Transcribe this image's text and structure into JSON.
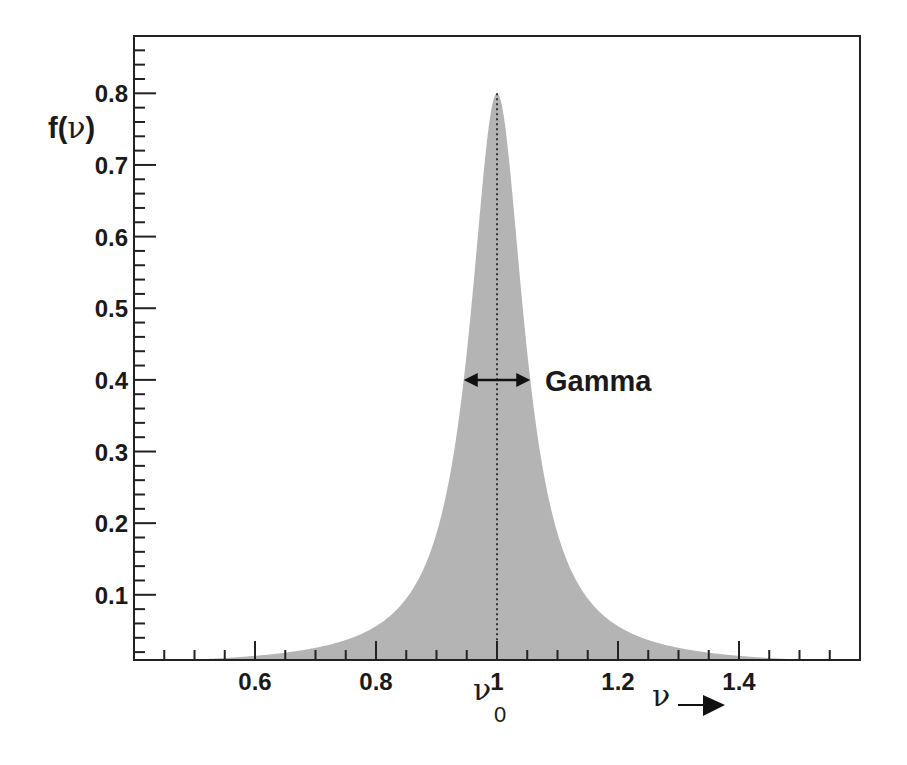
{
  "chart_data": {
    "type": "area",
    "title": "",
    "xlabel": "ν",
    "ylabel": "f(ν)",
    "xlim": [
      0.4,
      1.6
    ],
    "ylim": [
      0.009,
      0.88
    ],
    "x_ticks": [
      0.6,
      0.8,
      1,
      1.2,
      1.4
    ],
    "x_tick_labels": [
      "0.6",
      "0.8",
      "1",
      "1.2",
      "1.4"
    ],
    "y_ticks": [
      0.1,
      0.2,
      0.3,
      0.4,
      0.5,
      0.6,
      0.7,
      0.8
    ],
    "y_tick_labels": [
      "0.1",
      "0.2",
      "0.3",
      "0.4",
      "0.5",
      "0.6",
      "0.7",
      "0.8"
    ],
    "grid": false,
    "legend": null,
    "fill_color": "#b4b4b4",
    "series": [
      {
        "name": "f(ν)",
        "peak_x": 1.0,
        "peak_y": 0.8,
        "fwhm": 0.11,
        "x_range": [
          0.5,
          1.5
        ],
        "x": [
          0.5,
          0.6,
          0.7,
          0.8,
          0.85,
          0.9,
          0.92,
          0.94,
          0.96,
          0.98,
          1.0,
          1.02,
          1.04,
          1.06,
          1.08,
          1.1,
          1.15,
          1.2,
          1.3,
          1.4,
          1.5
        ],
        "y": [
          0.01,
          0.015,
          0.026,
          0.056,
          0.095,
          0.185,
          0.257,
          0.363,
          0.524,
          0.706,
          0.8,
          0.706,
          0.524,
          0.363,
          0.257,
          0.185,
          0.095,
          0.056,
          0.026,
          0.015,
          0.01
        ]
      }
    ],
    "annotations": [
      {
        "text": "Gamma",
        "type": "double-arrow",
        "y": 0.4,
        "x_from": 0.945,
        "x_to": 1.055
      },
      {
        "text": "ν",
        "subscript": "0",
        "x": 1.0,
        "note": "vertical dotted line at ν0"
      },
      {
        "text": "ν",
        "type": "arrow-right",
        "note": "x-axis direction"
      }
    ]
  },
  "labels": {
    "ylabel_main": "f(",
    "ylabel_greek": "ν",
    "ylabel_close": ")",
    "gamma": "Gamma",
    "nu0_main": "ν",
    "nu0_sub": "0",
    "xarrow_label": "ν"
  }
}
